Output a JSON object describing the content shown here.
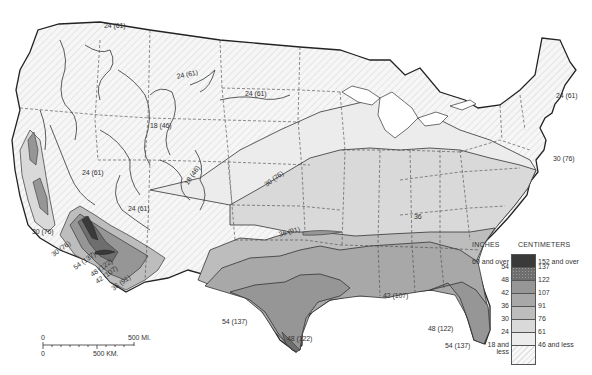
{
  "map": {
    "subject": "Precipitation isolines, conterminous United States",
    "colors": {
      "background": "#ffffff",
      "land_lowest": "#f4f4f4",
      "c24_30": "#ececec",
      "c30_36": "#d9d9d9",
      "c36_42": "#bdbdbd",
      "c42_48": "#a8a8a8",
      "c48_54": "#969696",
      "c54_60": "#6e6e6e",
      "c60_over": "#3a3a3a",
      "lines": "#333333"
    },
    "isoline_labels": [
      {
        "text": "24 (61)",
        "x": 104,
        "y": 26,
        "rot": 0
      },
      {
        "text": "24 (61)",
        "x": 176,
        "y": 77,
        "rot": -12
      },
      {
        "text": "24 (61)",
        "x": 245,
        "y": 94,
        "rot": 0
      },
      {
        "text": "18 (46)",
        "x": 150,
        "y": 126,
        "rot": 0
      },
      {
        "text": "24 (61)",
        "x": 556,
        "y": 96,
        "rot": 0
      },
      {
        "text": "24 (61)",
        "x": 82,
        "y": 173,
        "rot": 0
      },
      {
        "text": "30 (76)",
        "x": 553,
        "y": 159,
        "rot": 0
      },
      {
        "text": "30 (76)",
        "x": 263,
        "y": 186,
        "rot": -35
      },
      {
        "text": "18 (46)",
        "x": 183,
        "y": 186,
        "rot": -55
      },
      {
        "text": "24 (61)",
        "x": 128,
        "y": 209,
        "rot": 0
      },
      {
        "text": "30 (76)",
        "x": 32,
        "y": 232,
        "rot": 0
      },
      {
        "text": "36 (91)",
        "x": 278,
        "y": 235,
        "rot": -15
      },
      {
        "text": "30 (76)",
        "x": 50,
        "y": 256,
        "rot": -35
      },
      {
        "text": "54 (137)",
        "x": 72,
        "y": 269,
        "rot": -35
      },
      {
        "text": "48 (122)",
        "x": 89,
        "y": 276,
        "rot": -35
      },
      {
        "text": "42 (107)",
        "x": 94,
        "y": 283,
        "rot": -35
      },
      {
        "text": "36 (91)",
        "x": 110,
        "y": 290,
        "rot": -35
      },
      {
        "text": "36",
        "x": 414,
        "y": 217,
        "rot": 0
      },
      {
        "text": "42 (107)",
        "x": 383,
        "y": 296,
        "rot": 0
      },
      {
        "text": "54 (137)",
        "x": 222,
        "y": 322,
        "rot": 0
      },
      {
        "text": "48 (122)",
        "x": 287,
        "y": 339,
        "rot": 0
      },
      {
        "text": "48 (122)",
        "x": 428,
        "y": 329,
        "rot": 0
      },
      {
        "text": "54 (137)",
        "x": 445,
        "y": 346,
        "rot": 0
      }
    ]
  },
  "legend": {
    "header_inches": "INCHES",
    "header_cm": "CENTIMETERS",
    "classes": [
      {
        "inches": "60 and over",
        "cm": "152 and over",
        "color": "#3a3a3a",
        "pattern": "dark"
      },
      {
        "inches": "54",
        "cm": "137",
        "color": "#6e6e6e",
        "pattern": "dots"
      },
      {
        "inches": "48",
        "cm": "122",
        "color": "#969696",
        "pattern": "solid"
      },
      {
        "inches": "42",
        "cm": "107",
        "color": "#a8a8a8",
        "pattern": "solid"
      },
      {
        "inches": "36",
        "cm": "91",
        "color": "#bdbdbd",
        "pattern": "solid"
      },
      {
        "inches": "30",
        "cm": "76",
        "color": "#d9d9d9",
        "pattern": "solid"
      },
      {
        "inches": "24",
        "cm": "61",
        "color": "#ececec",
        "pattern": "solid"
      },
      {
        "inches": "18 and less",
        "cm": "46 and less",
        "color": "#f4f4f4",
        "pattern": "hatch"
      }
    ],
    "lowest_cm_label": "46 and less",
    "lowest_in_label_1": "18 and",
    "lowest_in_label_2": "less"
  },
  "scale_bar": {
    "miles_zero": "0",
    "miles_label": "500 MI.",
    "km_zero": "0",
    "km_label": "500 KM."
  }
}
